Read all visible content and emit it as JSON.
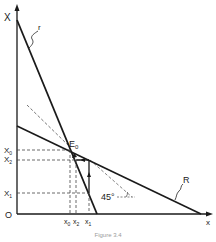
{
  "diagram": {
    "axes": {
      "y_label": "X",
      "x_label": "x",
      "origin_label": "O"
    },
    "curves": {
      "steep_line_label": "r",
      "flat_line_label": "R"
    },
    "point": {
      "label": "E",
      "subscript": "0"
    },
    "y_ticks": [
      {
        "main": "X",
        "sub": "0"
      },
      {
        "main": "X",
        "sub": "2"
      },
      {
        "main": "X",
        "sub": "1"
      }
    ],
    "x_ticks": [
      {
        "main": "x",
        "sub": "0"
      },
      {
        "main": "x",
        "sub": "2"
      },
      {
        "main": "x",
        "sub": "1"
      }
    ],
    "angle_label": "45°",
    "caption": "Figure 3.4",
    "colors": {
      "line": "#1a1a1a",
      "dashed": "#555555",
      "background": "#ffffff"
    }
  }
}
